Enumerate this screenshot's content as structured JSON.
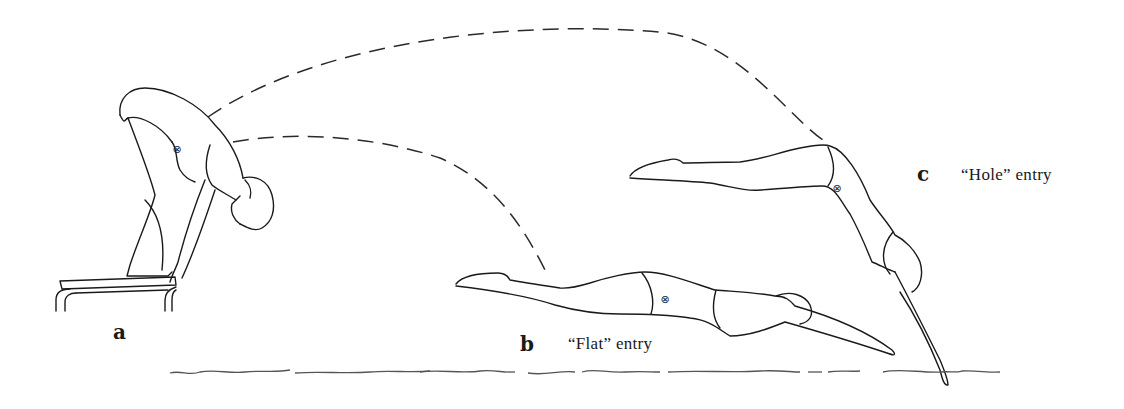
{
  "figure": {
    "labels": {
      "a": {
        "letter": "a",
        "caption": ""
      },
      "b": {
        "letter": "b",
        "caption": "“Flat” entry"
      },
      "c": {
        "letter": "c",
        "caption": "“Hole” entry"
      }
    },
    "markers": {
      "center_of_gravity_symbol": "⊗"
    },
    "colors": {
      "ink": "#1a1a1a",
      "water": "#555555",
      "background": "#ffffff"
    }
  }
}
